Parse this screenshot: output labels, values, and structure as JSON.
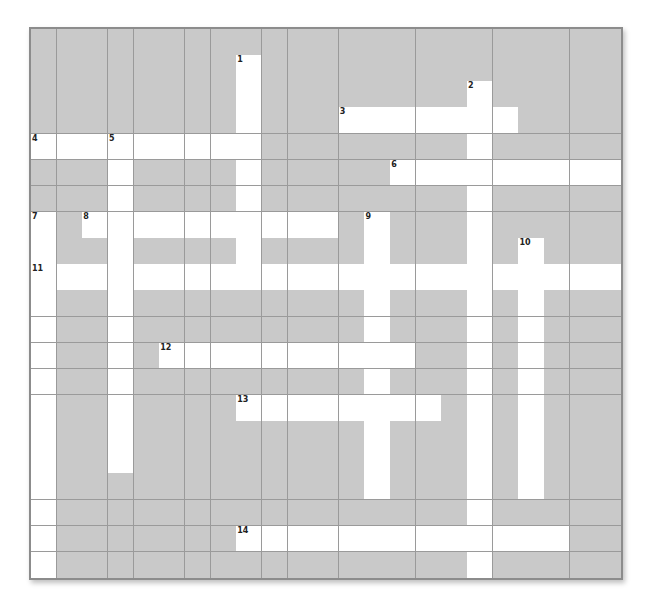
{
  "puzzle": {
    "cols": 23,
    "rows": 21,
    "colors": {
      "blocked": "#c9c9c9",
      "open": "#ffffff",
      "gridline": "#9a9a9a",
      "border": "#8c8c8c",
      "number": "#222222"
    },
    "entries": [
      {
        "number": "1",
        "direction": "down",
        "row": 1,
        "col": 8,
        "length": 9
      },
      {
        "number": "2",
        "direction": "down",
        "row": 2,
        "col": 17,
        "length": 19
      },
      {
        "number": "3",
        "direction": "across",
        "row": 3,
        "col": 12,
        "length": 7
      },
      {
        "number": "4",
        "direction": "across",
        "row": 4,
        "col": 0,
        "length": 9
      },
      {
        "number": "5",
        "direction": "down",
        "row": 4,
        "col": 3,
        "length": 13
      },
      {
        "number": "6",
        "direction": "across",
        "row": 5,
        "col": 14,
        "length": 9
      },
      {
        "number": "7",
        "direction": "down",
        "row": 7,
        "col": 0,
        "length": 14
      },
      {
        "number": "8",
        "direction": "across",
        "row": 7,
        "col": 2,
        "length": 10
      },
      {
        "number": "9",
        "direction": "down",
        "row": 7,
        "col": 13,
        "length": 11
      },
      {
        "number": "10",
        "direction": "down",
        "row": 8,
        "col": 19,
        "length": 10
      },
      {
        "number": "11",
        "direction": "across",
        "row": 9,
        "col": 0,
        "length": 23
      },
      {
        "number": "12",
        "direction": "across",
        "row": 12,
        "col": 5,
        "length": 10
      },
      {
        "number": "13",
        "direction": "across",
        "row": 14,
        "col": 8,
        "length": 8
      },
      {
        "number": "14",
        "direction": "across",
        "row": 19,
        "col": 8,
        "length": 13
      }
    ]
  }
}
